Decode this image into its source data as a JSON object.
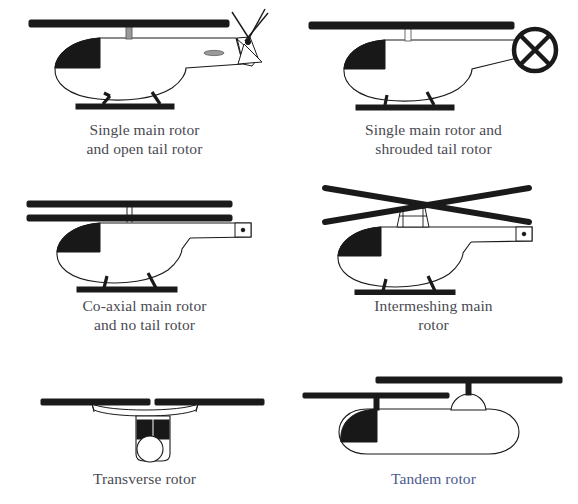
{
  "figure": {
    "background_color": "#ffffff",
    "ink_color": "#1a1a1a",
    "caption_color": "#4a4a52",
    "caption_color_alt": "#4b5a8e",
    "columns": 2,
    "rows": 3
  },
  "panels": [
    {
      "id": "single-main-open-tail",
      "position": {
        "row": 1,
        "col": 1
      },
      "caption": "Single main rotor\nand open tail rotor",
      "caption_line1": "Single main rotor",
      "caption_line2": "and open tail rotor",
      "view": "side",
      "features": [
        "main-rotor-disc",
        "rotor-mast",
        "fuselage",
        "dark-cockpit-window",
        "tail-boom",
        "skid-landing-gear",
        "open-tail-rotor",
        "vertical-fin",
        "horizontal-stabilizer"
      ]
    },
    {
      "id": "single-main-shrouded-tail",
      "position": {
        "row": 1,
        "col": 2
      },
      "caption": "Single main rotor and\nshrouded tail rotor",
      "caption_line1": "Single main rotor and",
      "caption_line2": "shrouded tail rotor",
      "view": "side",
      "features": [
        "main-rotor-disc",
        "rotor-mast",
        "fuselage",
        "dark-cockpit-window",
        "tail-boom",
        "skid-landing-gear",
        "shrouded-tail-rotor-fenestron"
      ]
    },
    {
      "id": "co-axial-main-no-tail",
      "position": {
        "row": 2,
        "col": 1
      },
      "caption": "Co-axial main rotor\nand no tail rotor",
      "caption_line1": "Co-axial main rotor",
      "caption_line2": "and no tail rotor",
      "view": "side",
      "features": [
        "upper-rotor-disc",
        "lower-rotor-disc",
        "twin-mast",
        "fuselage",
        "dark-cockpit-window",
        "tail-boom",
        "tail-end-box",
        "skid-landing-gear"
      ]
    },
    {
      "id": "intermeshing-main",
      "position": {
        "row": 2,
        "col": 2
      },
      "caption": "Intermeshing main\nrotor",
      "caption_line1": "Intermeshing main",
      "caption_line2": "rotor",
      "view": "side",
      "features": [
        "crossed-rotor-blade-pair-a",
        "crossed-rotor-blade-pair-b",
        "twin-mast-housing",
        "fuselage",
        "dark-cockpit-window",
        "tail-boom",
        "tail-end-box",
        "skid-landing-gear"
      ]
    },
    {
      "id": "transverse-rotor",
      "position": {
        "row": 3,
        "col": 1
      },
      "caption": "Transverse rotor",
      "caption_line1": "Transverse rotor",
      "caption_line2": "",
      "view": "front",
      "features": [
        "left-rotor-disc",
        "right-rotor-disc",
        "wing",
        "fuselage-front",
        "dark-windscreen-left",
        "dark-windscreen-right",
        "nose-circle"
      ]
    },
    {
      "id": "tandem-rotor",
      "position": {
        "row": 3,
        "col": 2
      },
      "caption": "Tandem rotor",
      "caption_line1": "Tandem rotor",
      "caption_line2": "",
      "view": "side",
      "caption_style": "blue",
      "features": [
        "forward-rotor-disc",
        "aft-rotor-disc",
        "forward-mast",
        "aft-pylon",
        "fuselage-capsule",
        "dark-cockpit-window"
      ]
    }
  ]
}
